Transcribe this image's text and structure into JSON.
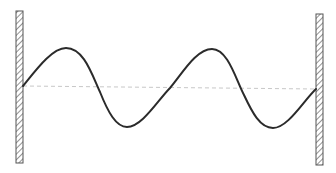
{
  "diagram": {
    "type": "standing-wave-between-fixed-walls",
    "colors": {
      "background": "#ffffff",
      "wave": "#2b2b2b",
      "equilibrium_line": "#c8c8c8",
      "wall_stroke": "#555555",
      "wall_hatch": "#777777"
    },
    "left_wall": {
      "x": 16,
      "y": 11,
      "width": 7,
      "height": 152
    },
    "right_wall": {
      "x": 316,
      "y": 14,
      "width": 7,
      "height": 151
    },
    "equilibrium_line": {
      "x1": 23,
      "y1": 86,
      "x2": 316,
      "y2": 89
    },
    "wave_path": "M23,86 C36,70 52,48 66,48 C84,48 92,75 100,92 C108,112 116,127 127,127 C142,127 158,100 170,88 C182,74 196,49 212,49 C228,49 236,80 244,95 C252,112 260,128 273,128 C288,128 304,100 316,89"
  }
}
